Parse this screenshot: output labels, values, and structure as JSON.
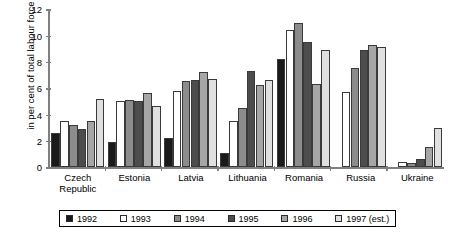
{
  "chart_data": {
    "type": "bar",
    "title": "",
    "xlabel": "",
    "ylabel": "in per cent of total labour force",
    "ylim": [
      0,
      12
    ],
    "yticks": [
      0,
      2,
      4,
      6,
      8,
      10,
      12
    ],
    "grid": false,
    "legend_position": "bottom",
    "categories": [
      "Czech Republic",
      "Estonia",
      "Latvia",
      "Lithuania",
      "Romania",
      "Russia",
      "Ukraine"
    ],
    "series": [
      {
        "name": "1992",
        "color": "#1a1a1a",
        "values": [
          2.6,
          1.9,
          2.2,
          1.1,
          8.2,
          null,
          null
        ]
      },
      {
        "name": "1993",
        "color": "#ffffff",
        "values": [
          3.5,
          5.0,
          5.8,
          3.5,
          10.4,
          5.7,
          0.4
        ]
      },
      {
        "name": "1994",
        "color": "#8c8c8c",
        "values": [
          3.2,
          5.1,
          6.5,
          4.5,
          10.9,
          7.5,
          0.3
        ]
      },
      {
        "name": "1995",
        "color": "#4d4d4d",
        "values": [
          2.9,
          5.0,
          6.6,
          7.3,
          9.5,
          8.9,
          0.6
        ]
      },
      {
        "name": "1996",
        "color": "#a6a6a6",
        "values": [
          3.5,
          5.6,
          7.2,
          6.2,
          6.3,
          9.3,
          1.5
        ]
      },
      {
        "name": "1997 (est.)",
        "color": "#e0e0e0",
        "values": [
          5.2,
          4.6,
          6.7,
          6.6,
          8.9,
          9.1,
          3.0
        ]
      }
    ]
  }
}
